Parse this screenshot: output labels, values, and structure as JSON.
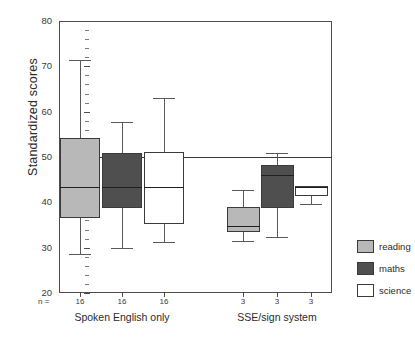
{
  "chart_data": {
    "type": "box",
    "title": "",
    "xlabel": "",
    "ylabel": "Standardized scores",
    "ylim": [
      20,
      80
    ],
    "y_ticks_major": [
      20,
      30,
      40,
      50,
      60,
      70,
      80
    ],
    "y_tick_labels": [
      "20",
      "30",
      "40",
      "50",
      "60",
      "70",
      "80"
    ],
    "grid": false,
    "reference_line": 50,
    "legend_position": "right",
    "n_prefix_label": "n =",
    "groups": [
      {
        "label": "Spoken English only",
        "boxes": [
          {
            "series": "reading",
            "n": "16",
            "whisker_low": 28.6,
            "q1": 36.5,
            "median": 43.3,
            "q3": 54.3,
            "whisker_high": 71.4
          },
          {
            "series": "maths",
            "n": "16",
            "whisker_low": 30.0,
            "q1": 38.8,
            "median": 43.4,
            "q3": 50.8,
            "whisker_high": 57.7
          },
          {
            "series": "science",
            "n": "16",
            "whisker_low": 31.2,
            "q1": 35.3,
            "median": 43.3,
            "q3": 51.1,
            "whisker_high": 63.0
          }
        ]
      },
      {
        "label": "SSE/sign system",
        "boxes": [
          {
            "series": "reading",
            "n": "3",
            "whisker_low": 31.5,
            "q1": 33.5,
            "median": 34.8,
            "q3": 38.9,
            "whisker_high": 42.8
          },
          {
            "series": "maths",
            "n": "3",
            "whisker_low": 32.3,
            "q1": 38.8,
            "median": 46.0,
            "q3": 48.3,
            "whisker_high": 50.8
          },
          {
            "series": "science",
            "n": "3",
            "whisker_low": 39.6,
            "q1": 41.5,
            "median": 43.4,
            "q3": 43.5,
            "whisker_high": 43.5
          }
        ]
      }
    ],
    "legend": [
      {
        "key": "reading",
        "label": "reading",
        "color": "#b8b8b8"
      },
      {
        "key": "maths",
        "label": "maths",
        "color": "#4f4f4f"
      },
      {
        "key": "science",
        "label": "science",
        "color": "#ffffff"
      }
    ]
  }
}
